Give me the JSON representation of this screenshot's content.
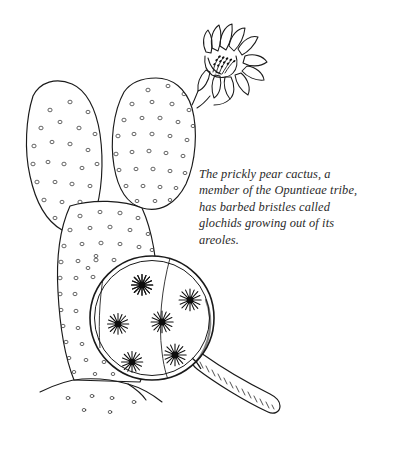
{
  "illustration": {
    "title": "Prickly pear cactus with magnifying glass",
    "subject": "prickly-pear-cactus",
    "style": "pen-and-ink line drawing",
    "background_color": "#ffffff",
    "ink_color": "#1a1a1a",
    "caption": {
      "text": "The prickly pear cactus, a member of the Opuntieae tribe, has barbed bristles called glochids growing out of its areoles.",
      "lines": [
        "The prickly pear cactus, a member",
        "of the Opuntieae tribe, has barbed",
        "bristles called glochids growing out of",
        "its areoles."
      ],
      "color": "#2b2b2b",
      "style": "italic-serif"
    },
    "parts": {
      "flower_label": "cactus flower",
      "pad_left_label": "left cactus pad",
      "pad_upper_right_label": "upper right cactus pad",
      "pad_main_label": "main cactus pad",
      "ground_label": "ground line",
      "lens_label": "magnifying glass lens",
      "handle_label": "magnifying glass handle",
      "glochid_label": "magnified glochid areole",
      "areole_label": "areole dot"
    },
    "counts": {
      "pads": 3,
      "magnified_glochids": 6,
      "flower_petals": 9
    }
  }
}
